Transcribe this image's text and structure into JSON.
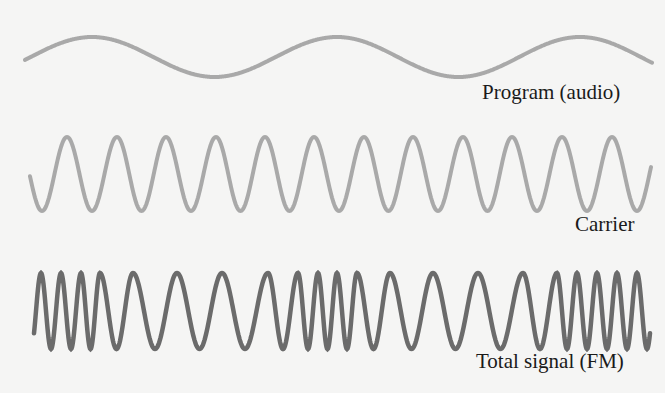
{
  "labels": {
    "program": "Program (audio)",
    "carrier": "Carrier",
    "fm": "Total signal (FM)"
  },
  "colors": {
    "background": "#f5f5f4",
    "program": "#a9a9a9",
    "carrier": "#a9a9a9",
    "fm": "#6b6b6b"
  },
  "chart_data": {
    "type": "line",
    "series": [
      {
        "name": "Program (audio)",
        "x_start": 25,
        "x_end": 652,
        "center_y": 57,
        "amplitude": 20,
        "peaks_x": [
          92,
          337,
          580
        ]
      },
      {
        "name": "Carrier",
        "x_start": 30,
        "x_end": 651,
        "center_y": 174,
        "amplitude": 37,
        "peaks_x": [
          67,
          117,
          166,
          216,
          265,
          314,
          364,
          413,
          463,
          512,
          562,
          612
        ]
      },
      {
        "name": "Total signal (FM)",
        "x_start": 34,
        "x_end": 650,
        "center_y": 311,
        "amplitude": 38,
        "peaks_x": [
          41,
          61,
          81,
          100,
          133,
          177,
          222,
          268,
          298,
          318,
          337,
          357,
          390,
          433,
          478,
          523,
          557,
          577,
          597,
          617,
          637
        ]
      }
    ]
  }
}
